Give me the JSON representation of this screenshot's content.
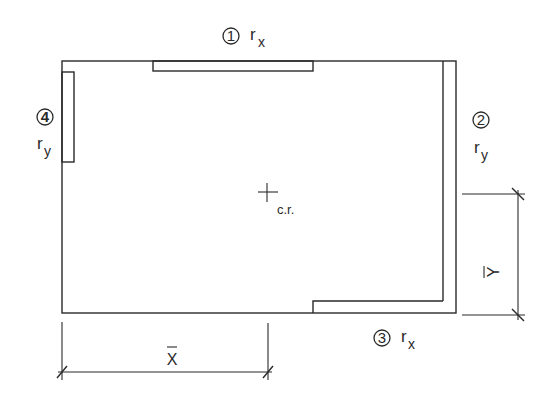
{
  "diagram": {
    "type": "plan-view",
    "walls": [
      {
        "id": "1",
        "number": "1",
        "label": "r",
        "subscript": "x",
        "position": "top"
      },
      {
        "id": "2",
        "number": "2",
        "label": "r",
        "subscript": "y",
        "position": "right"
      },
      {
        "id": "3",
        "number": "3",
        "label": "r",
        "subscript": "x",
        "position": "bottom"
      },
      {
        "id": "4",
        "number": "4",
        "label": "r",
        "subscript": "y",
        "position": "left"
      }
    ],
    "center_of_rigidity": {
      "label": "c.r."
    },
    "dimensions": {
      "x_bar": {
        "label": "X",
        "overbar": true,
        "orientation": "horizontal"
      },
      "y_bar": {
        "label": "Y",
        "overbar": true,
        "orientation": "vertical"
      }
    }
  }
}
